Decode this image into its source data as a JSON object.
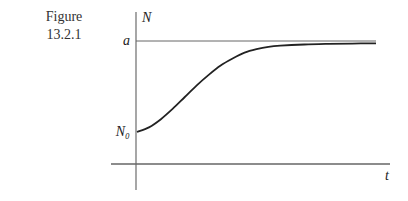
{
  "figure": {
    "caption_word": "Figure",
    "caption_number": "13.2.1"
  },
  "chart_data": {
    "type": "line",
    "title": "",
    "xlabel": "t",
    "ylabel": "N",
    "y_ticks": [
      {
        "label": "a",
        "value": 1.0
      },
      {
        "label": "N₀",
        "value": 0.22
      }
    ],
    "xlim": [
      0,
      1
    ],
    "ylim": [
      -0.28,
      1.2
    ],
    "grid": false,
    "asymptote": {
      "label": "a",
      "value": 1.0
    },
    "series": [
      {
        "name": "logistic growth N(t)",
        "x": [
          0,
          0.05,
          0.1,
          0.15,
          0.2,
          0.25,
          0.3,
          0.35,
          0.4,
          0.45,
          0.5,
          0.55,
          0.6,
          0.7,
          0.8,
          0.9,
          1.0
        ],
        "y": [
          0.22,
          0.26,
          0.33,
          0.42,
          0.52,
          0.62,
          0.71,
          0.79,
          0.85,
          0.9,
          0.93,
          0.95,
          0.96,
          0.97,
          0.975,
          0.978,
          0.98
        ]
      }
    ]
  }
}
